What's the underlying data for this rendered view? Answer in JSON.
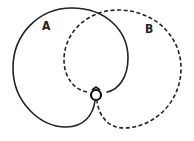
{
  "diagram": {
    "type": "polar-pattern",
    "patterns": [
      {
        "label": "A",
        "style": "solid",
        "color": "#222222"
      },
      {
        "label": "B",
        "style": "dashed",
        "color": "#222222"
      }
    ],
    "center_object": "microphone"
  }
}
